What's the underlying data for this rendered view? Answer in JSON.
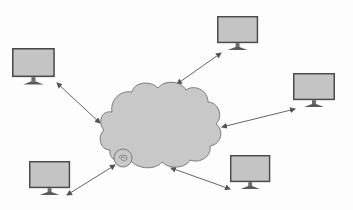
{
  "diagram": {
    "title": "Network cloud connected to five computers",
    "type": "network-topology",
    "colors": {
      "background": "#fdfdfd",
      "cloud_fill": "#c8c8c8",
      "cloud_stroke": "#7a7a7a",
      "monitor_frame": "#4a4a4a",
      "monitor_screen": "#c4c4c4",
      "monitor_stand": "#5a5a5a",
      "arrow": "#555555"
    },
    "center_node": {
      "id": "cloud",
      "label": "Network cloud",
      "bbox": [
        100,
        82,
        222,
        170
      ]
    },
    "nodes": [
      {
        "id": "computer-top-left",
        "label": "Computer",
        "screen": [
          12,
          48,
          43,
          29
        ]
      },
      {
        "id": "computer-top-middle",
        "label": "Computer",
        "screen": [
          217,
          16,
          41,
          27
        ]
      },
      {
        "id": "computer-right",
        "label": "Computer",
        "screen": [
          293,
          73,
          42,
          27
        ]
      },
      {
        "id": "computer-bottom-left",
        "label": "Computer",
        "screen": [
          29,
          161,
          41,
          27
        ]
      },
      {
        "id": "computer-bottom-right",
        "label": "Computer",
        "screen": [
          230,
          155,
          40,
          27
        ]
      }
    ],
    "edges": [
      {
        "from": "computer-top-left",
        "to": "cloud",
        "bidirectional": true,
        "line": [
          57,
          83,
          100,
          123
        ]
      },
      {
        "from": "computer-top-middle",
        "to": "cloud",
        "bidirectional": true,
        "line": [
          221,
          53,
          177,
          84
        ]
      },
      {
        "from": "computer-right",
        "to": "cloud",
        "bidirectional": true,
        "line": [
          295,
          109,
          222,
          127
        ]
      },
      {
        "from": "computer-bottom-left",
        "to": "cloud",
        "bidirectional": true,
        "line": [
          67,
          195,
          115,
          165
        ]
      },
      {
        "from": "computer-bottom-right",
        "to": "cloud",
        "bidirectional": true,
        "line": [
          230,
          189,
          171,
          168
        ]
      }
    ]
  }
}
